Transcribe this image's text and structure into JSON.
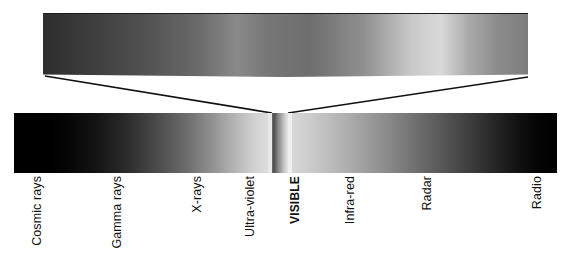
{
  "figure": {
    "cut_caption": "",
    "background_color": "#ffffff",
    "ink_color": "#101010"
  },
  "detail_bar": {
    "name": "magnified visible spectrum strip",
    "description": "Grayscale rendering of the visible band, enlarged",
    "stops": [
      {
        "pos": 0,
        "color": "#2e2e2e"
      },
      {
        "pos": 8,
        "color": "#3a3a3a"
      },
      {
        "pos": 20,
        "color": "#4f4f4f"
      },
      {
        "pos": 32,
        "color": "#6a6a6a"
      },
      {
        "pos": 40,
        "color": "#8a8a8a"
      },
      {
        "pos": 46,
        "color": "#777777"
      },
      {
        "pos": 55,
        "color": "#6e6e6e"
      },
      {
        "pos": 66,
        "color": "#8f8f8f"
      },
      {
        "pos": 76,
        "color": "#c9c9c9"
      },
      {
        "pos": 82,
        "color": "#d9d9d9"
      },
      {
        "pos": 88,
        "color": "#a8a8a8"
      },
      {
        "pos": 94,
        "color": "#8b8b8b"
      },
      {
        "pos": 100,
        "color": "#7d7d7d"
      }
    ]
  },
  "leader_lines": {
    "name": "callout lines linking visible band to magnified strip",
    "left": {
      "x1": 45,
      "y1": 76,
      "x2": 272,
      "y2": 113
    },
    "right": {
      "x1": 288,
      "y1": 113,
      "x2": 528,
      "y2": 77
    },
    "color": "#101010",
    "width": 1.6
  },
  "main_bar": {
    "name": "full electromagnetic spectrum bar",
    "segments": {
      "left": {
        "stops": [
          {
            "pos": 0,
            "color": "#000000"
          },
          {
            "pos": 12,
            "color": "#000000"
          },
          {
            "pos": 20,
            "color": "#040404"
          },
          {
            "pos": 32,
            "color": "#131313"
          },
          {
            "pos": 44,
            "color": "#2b2b2b"
          },
          {
            "pos": 56,
            "color": "#4a4a4a"
          },
          {
            "pos": 68,
            "color": "#6d6d6d"
          },
          {
            "pos": 78,
            "color": "#919191"
          },
          {
            "pos": 88,
            "color": "#b9b9b9"
          },
          {
            "pos": 95,
            "color": "#d2d2d2"
          },
          {
            "pos": 100,
            "color": "#dcdcdc"
          }
        ]
      },
      "gap_left": {
        "color": "#e8e8e8"
      },
      "visible": {
        "stops": [
          {
            "pos": 0,
            "color": "#6f6f6f"
          },
          {
            "pos": 12,
            "color": "#4c4c4c"
          },
          {
            "pos": 26,
            "color": "#6b6b6b"
          },
          {
            "pos": 42,
            "color": "#8d8d8d"
          },
          {
            "pos": 58,
            "color": "#a7a7a7"
          },
          {
            "pos": 74,
            "color": "#c2c2c2"
          },
          {
            "pos": 88,
            "color": "#d8d8d8"
          },
          {
            "pos": 100,
            "color": "#e2e2e2"
          }
        ]
      },
      "gap_right": {
        "color": "#efefef"
      },
      "right": {
        "stops": [
          {
            "pos": 0,
            "color": "#d8d8d8"
          },
          {
            "pos": 8,
            "color": "#c9c9c9"
          },
          {
            "pos": 20,
            "color": "#b0b0b0"
          },
          {
            "pos": 34,
            "color": "#8f8f8f"
          },
          {
            "pos": 48,
            "color": "#6c6c6c"
          },
          {
            "pos": 62,
            "color": "#4a4a4a"
          },
          {
            "pos": 74,
            "color": "#2c2c2c"
          },
          {
            "pos": 85,
            "color": "#121212"
          },
          {
            "pos": 93,
            "color": "#040404"
          },
          {
            "pos": 100,
            "color": "#000000"
          }
        ]
      }
    }
  },
  "bands": [
    {
      "label": "Cosmic rays",
      "x": 30,
      "emphasis": false
    },
    {
      "label": "Gamma rays",
      "x": 110,
      "emphasis": false
    },
    {
      "label": "X-rays",
      "x": 190,
      "emphasis": false
    },
    {
      "label": "Ultra-violet",
      "x": 243,
      "emphasis": false
    },
    {
      "label": "VISIBLE",
      "x": 288,
      "emphasis": true
    },
    {
      "label": "Infra-red",
      "x": 343,
      "emphasis": false
    },
    {
      "label": "Radar",
      "x": 420,
      "emphasis": false
    },
    {
      "label": "Radio",
      "x": 530,
      "emphasis": false
    }
  ]
}
